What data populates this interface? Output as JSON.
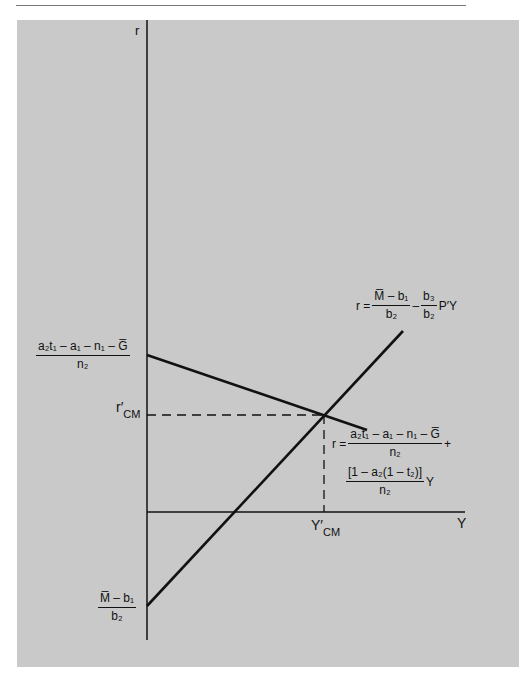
{
  "figure": {
    "panel_color": "#c9c9c9",
    "line_color": "#111111"
  },
  "axes": {
    "y_label": "r",
    "x_label": "Y"
  },
  "labels": {
    "r_cm_main": "r′",
    "r_cm_sub": "CM",
    "y_cm_main": "Y′",
    "y_cm_sub": "CM"
  },
  "intercepts": {
    "is_intercept": {
      "numerator": "a₂t₁ – a₁ – n₁ – G̅",
      "denominator": "n₂"
    },
    "lm_intercept": {
      "numerator": "M̅ – b₁",
      "denominator": "b₂"
    }
  },
  "equations": {
    "lm_curve": {
      "lhs": "r =",
      "frac1_num": "M̅ – b₁",
      "frac1_den": "b₂",
      "op": "–",
      "frac2_num": "b₃",
      "frac2_den": "b₂",
      "tail": "P′Y"
    },
    "is_curve": {
      "lhs": "r =",
      "frac1_num": "a₂t₁ – a₁ – n₁ – G̅",
      "frac1_den": "n₂",
      "plus": "+",
      "frac2_num": "[1 – a₂(1 – t₂)]",
      "frac2_den": "n₂",
      "tail": "Y"
    }
  },
  "geometry": {
    "y_axis": {
      "x": 147,
      "y1": 20,
      "y2": 640
    },
    "x_axis": {
      "y": 512,
      "x1": 147,
      "x2": 465
    },
    "is_line": {
      "x1": 147,
      "y1": 355,
      "x2": 367,
      "y2": 430
    },
    "lm_line": {
      "x1": 147,
      "y1": 606,
      "x2": 403,
      "y2": 331
    },
    "equilibrium": {
      "x": 324,
      "y": 415
    }
  }
}
